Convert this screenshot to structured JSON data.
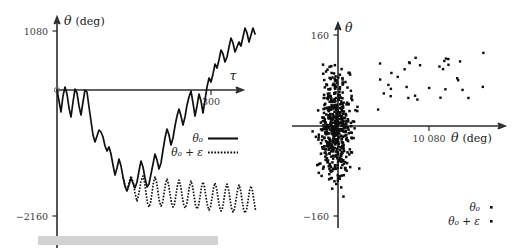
{
  "figure": {
    "title": "",
    "caption_bar": {
      "label": "",
      "color": "#d2d2d2"
    }
  },
  "left_panel": {
    "y_axis_label": "θ",
    "y_axis_unit": "(deg)",
    "x_axis_label": "τ",
    "y_ticks": [
      "1080",
      "−2160"
    ],
    "x_ticks": [
      "300"
    ],
    "origin_label": "0",
    "legend": [
      {
        "label": "θ₀",
        "style": "solid"
      },
      {
        "label": "θ₀ + ε",
        "style": "dotted"
      }
    ]
  },
  "right_panel": {
    "y_axis_label": "θ̇",
    "x_axis_label": "θ",
    "x_axis_unit": "(deg)",
    "y_ticks": [
      "160",
      "−160"
    ],
    "x_ticks": [
      "10 080"
    ],
    "legend": [
      {
        "label": "θ₀",
        "style": "dot"
      },
      {
        "label": "θ₀ + ε",
        "style": "dot"
      }
    ]
  },
  "chart_data": [
    {
      "type": "line",
      "panel": "left",
      "title": "",
      "xlabel": "τ",
      "ylabel": "θ (deg)",
      "xlim": [
        0,
        360
      ],
      "ylim": [
        -2160,
        1400
      ],
      "grid": false,
      "legend_position": "inside-right",
      "xticks": [
        300
      ],
      "yticks": [
        1080,
        -2160
      ],
      "series": [
        {
          "name": "θ₀",
          "style": "solid",
          "x": [
            0,
            4,
            8,
            12,
            16,
            20,
            24,
            28,
            32,
            36,
            40,
            44,
            48,
            52,
            56,
            60,
            64,
            68,
            72,
            76,
            80,
            84,
            88,
            92,
            96,
            100,
            104,
            108,
            112,
            116,
            120,
            124,
            128,
            132,
            136,
            140,
            144,
            148,
            152,
            156,
            160,
            164,
            168,
            172,
            176,
            180,
            184,
            188,
            192,
            196,
            200,
            204,
            208,
            212,
            216,
            220,
            224,
            228,
            232,
            236,
            240,
            244,
            248,
            252,
            256,
            260,
            264,
            268,
            272,
            276,
            280,
            284,
            288,
            292,
            296,
            300,
            304,
            308,
            312,
            316,
            320,
            324,
            328,
            332,
            336,
            340,
            344,
            348,
            352,
            356,
            360
          ],
          "y": [
            0,
            -210,
            -430,
            -120,
            60,
            -80,
            -350,
            -520,
            -230,
            30,
            -60,
            -300,
            -470,
            -210,
            0,
            -40,
            -330,
            -600,
            -860,
            -990,
            -870,
            -760,
            -800,
            -900,
            -1080,
            -1180,
            -1100,
            -1230,
            -1450,
            -1640,
            -1500,
            -1330,
            -1460,
            -1680,
            -1860,
            -1950,
            -1830,
            -1700,
            -1790,
            -1900,
            -1780,
            -1560,
            -1360,
            -1480,
            -1700,
            -1860,
            -1790,
            -1600,
            -1400,
            -1200,
            -1320,
            -1500,
            -1380,
            -1130,
            -880,
            -700,
            -830,
            -1020,
            -880,
            -640,
            -440,
            -300,
            -420,
            -600,
            -440,
            -200,
            -30,
            90,
            -140,
            -390,
            -200,
            40,
            -90,
            -330,
            -120,
            150,
            330,
            260,
            420,
            620,
            540,
            700,
            900,
            820,
            660,
            780,
            1000,
            1180,
            1080,
            900,
            1010,
            1220,
            1100,
            950,
            860,
            1040,
            1230,
            1140,
            960,
            1080,
            1260,
            1150
          ],
          "note": "chaotic rising trajectory, begins near 0, dips to about -1950 near τ≈140, recovers and climbs above +1080 after τ≈300"
        },
        {
          "name": "θ₀ + ε",
          "style": "dotted",
          "x_start": 128,
          "x_end": 360,
          "description": "diverges from θ₀ near τ≈128, settles into a regular oscillation of roughly constant amplitude about -2000 deg, period ≈ 16 τ units, amplitude ≈ ±230 deg",
          "oscillation_center": -2000,
          "oscillation_amplitude": 230,
          "oscillation_period": 16
        }
      ]
    },
    {
      "type": "scatter",
      "panel": "right",
      "title": "",
      "xlabel": "θ (deg)",
      "ylabel": "θ̇",
      "xlim": [
        -3500,
        17000
      ],
      "ylim": [
        -190,
        190
      ],
      "grid": false,
      "legend_position": "bottom-right",
      "xticks": [
        10080
      ],
      "yticks": [
        160,
        -160
      ],
      "series": [
        {
          "name": "θ₀",
          "marker": "dot",
          "description": "dense chaotic cloud of ~520 points centered near the origin, spanning roughly θ ∈ [-3200, 2600] deg and θ̇ ∈ [-175, 170]",
          "n_points": 520,
          "cluster_center": [
            -200,
            0
          ],
          "cluster_spread": [
            1500,
            75
          ]
        },
        {
          "name": "θ₀ + ε",
          "marker": "dot",
          "description": "sparse scattered points at large positive θ (roughly 4000 to 16500 deg) all with positive θ̇ between about 25 and 130",
          "n_points": 34,
          "x_range": [
            4000,
            16500
          ],
          "y_range": [
            25,
            130
          ]
        }
      ]
    }
  ]
}
